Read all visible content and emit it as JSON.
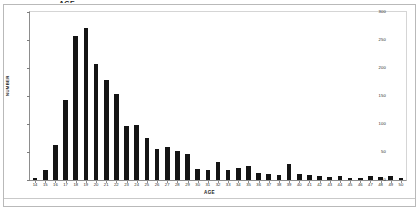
{
  "figure": {
    "title_clipped": "AGE",
    "background_color": "#ffffff",
    "bar_color": "#141414",
    "axis_color": "#8d8d8d"
  },
  "chart_data": {
    "type": "bar",
    "title": "",
    "xlabel": "AGE",
    "ylabel": "NUMBER",
    "xlim": [
      14,
      50
    ],
    "ylim": [
      0,
      300
    ],
    "grid": false,
    "legend": false,
    "ytick_labels": [
      "0",
      "50",
      "100",
      "150",
      "200",
      "250",
      "300"
    ],
    "ytick_values": [
      0,
      50,
      100,
      150,
      200,
      250,
      300
    ],
    "categories": [
      "14",
      "15",
      "16",
      "17",
      "18",
      "19",
      "20",
      "21",
      "22",
      "23",
      "24",
      "25",
      "26",
      "27",
      "28",
      "29",
      "30",
      "31",
      "32",
      "33",
      "34",
      "35",
      "36",
      "37",
      "38",
      "39",
      "40",
      "41",
      "42",
      "43",
      "44",
      "45",
      "46",
      "47",
      "48",
      "49",
      "50"
    ],
    "values": [
      3,
      18,
      62,
      143,
      258,
      272,
      207,
      178,
      154,
      97,
      98,
      75,
      55,
      59,
      51,
      46,
      20,
      18,
      32,
      17,
      21,
      25,
      13,
      11,
      9,
      28,
      11,
      9,
      8,
      6,
      8,
      4,
      4,
      8,
      6,
      7,
      3
    ]
  }
}
